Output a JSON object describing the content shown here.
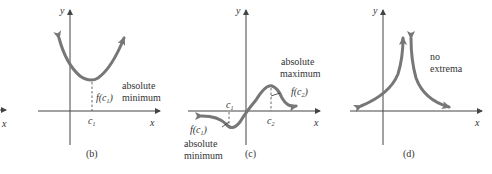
{
  "figure": {
    "partial_left": {
      "x_label": "x"
    },
    "panels": [
      {
        "id": "b",
        "caption": "(b)",
        "y_label": "y",
        "x_label": "x",
        "c_label": "c",
        "c_sub": "1",
        "f_label": "f(c",
        "f_sub": "1",
        "f_close": ")",
        "annotation_line1": "absolute",
        "annotation_line2": "minimum"
      },
      {
        "id": "c",
        "caption": "(c)",
        "y_label": "y",
        "x_label": "x",
        "c1_label": "c",
        "c1_sub": "1",
        "c2_label": "c",
        "c2_sub": "2",
        "f1_label": "f(c",
        "f1_sub": "1",
        "f1_close": ")",
        "f2_label": "f(c",
        "f2_sub": "2",
        "f2_close": ")",
        "max_line1": "absolute",
        "max_line2": "maximum",
        "min_line1": "absolute",
        "min_line2": "minimum"
      },
      {
        "id": "d",
        "caption": "(d)",
        "y_label": "y",
        "x_label": "x",
        "annotation_line1": "no",
        "annotation_line2": "extrema"
      }
    ]
  },
  "colors": {
    "curve": "#777777",
    "axis": "#444444",
    "text": "#333333"
  }
}
